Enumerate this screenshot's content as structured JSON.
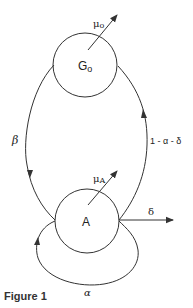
{
  "diagram": {
    "nodes": [
      {
        "id": "G0",
        "label_main": "G",
        "label_sub": "o",
        "cx": 85,
        "cy": 65,
        "r": 32
      },
      {
        "id": "A",
        "label_main": "A",
        "label_sub": "",
        "cx": 87,
        "cy": 221,
        "r": 32
      }
    ],
    "edges": [
      {
        "from": "G0",
        "to": "A",
        "label": "β",
        "side": "left"
      },
      {
        "from": "A",
        "to": "G0",
        "label": "1 - α - δ",
        "side": "right"
      },
      {
        "from": "A",
        "to": "A",
        "label": "α",
        "type": "self-loop"
      },
      {
        "from": "A",
        "to": "out",
        "label": "δ",
        "type": "exit"
      },
      {
        "from": "G0",
        "to": "out",
        "label_main": "μ",
        "label_sub": "o",
        "type": "death"
      },
      {
        "from": "A",
        "to": "out",
        "label_main": "μ",
        "label_sub": "A",
        "type": "death"
      }
    ],
    "labels": {
      "g0_main": "G",
      "g0_sub": "o",
      "a_node": "A",
      "mu0_main": "μ",
      "mu0_sub": "o",
      "muA_main": "μ",
      "muA_sub": "A",
      "beta": "β",
      "return": "1 - α - δ",
      "delta": "δ",
      "alpha": "α"
    },
    "colors": {
      "stroke": "#333333",
      "text": "#222222",
      "background": "#ffffff"
    }
  },
  "caption": "Figure 1"
}
